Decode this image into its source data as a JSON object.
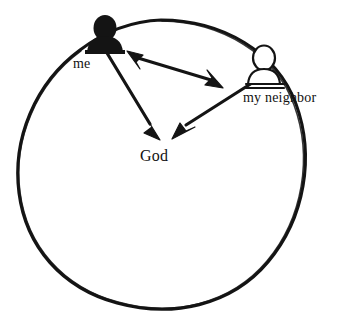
{
  "diagram": {
    "style": "hand-drawn black ink line art on white background",
    "background_color": "#ffffff",
    "ink_color": "#111111",
    "canvas": {
      "width": 341,
      "height": 318
    },
    "boundary": {
      "name": "circle",
      "shape": "hand-drawn circle",
      "center_x": 161,
      "center_y": 164,
      "radius_x": 143,
      "radius_y": 144,
      "stroke_width": 3,
      "filled": false
    },
    "nodes": [
      {
        "id": "me",
        "label": "me",
        "icon": "person-bust-filled-icon",
        "fill": "solid-black",
        "x": 105,
        "y": 35,
        "label_x": 73,
        "label_y": 57,
        "on_circle": true
      },
      {
        "id": "neighbor",
        "label": "my neighbor",
        "icon": "person-bust-outline-icon",
        "fill": "outline-white",
        "x": 264,
        "y": 68,
        "label_x": 243,
        "label_y": 91,
        "on_circle": true
      },
      {
        "id": "god",
        "label": "God",
        "icon": "none",
        "fill": "none",
        "x": 160,
        "y": 140,
        "label_x": 140,
        "label_y": 148,
        "on_circle": false
      }
    ],
    "arrows": [
      {
        "id": "me-neighbor",
        "from": "me",
        "to": "neighbor",
        "heads": "double",
        "description": "two-way arrow between me and my neighbor"
      },
      {
        "id": "me-god",
        "from": "me",
        "to": "god",
        "heads": "single",
        "description": "arrow from me down to God"
      },
      {
        "id": "neighbor-god",
        "from": "neighbor",
        "to": "god",
        "heads": "single",
        "description": "arrow from my neighbor down to God"
      }
    ]
  }
}
